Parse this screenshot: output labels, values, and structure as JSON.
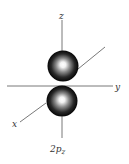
{
  "diagram": {
    "orbital_label": {
      "main": "2p",
      "sub": "z"
    },
    "axes": {
      "z": "z",
      "y": "y",
      "x": "x"
    },
    "colors": {
      "axis": "#555555",
      "lobe_dark": "#000000",
      "lobe_highlight": "#ffffff",
      "label": "#333333"
    }
  }
}
